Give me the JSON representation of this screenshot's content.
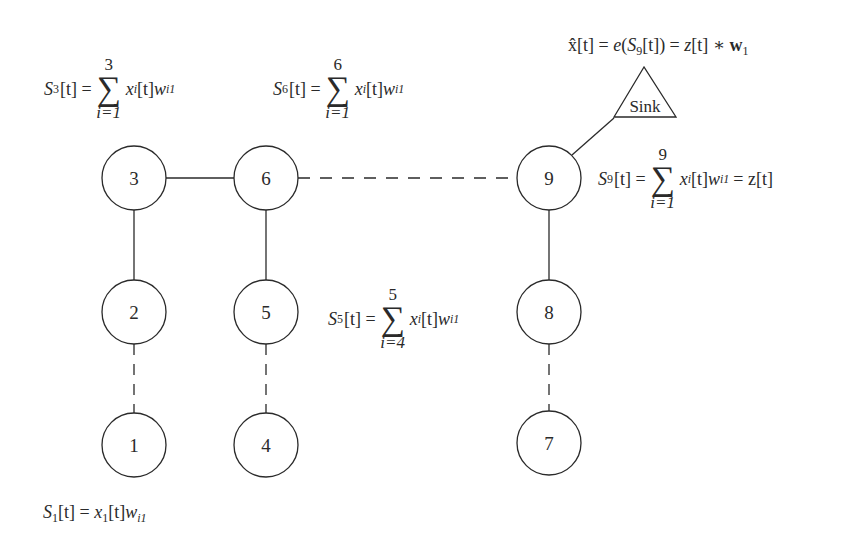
{
  "diagram": {
    "type": "sensor-network-aggregation",
    "nodes": [
      {
        "id": "1",
        "label": "1",
        "cx": 134,
        "cy": 445
      },
      {
        "id": "2",
        "label": "2",
        "cx": 134,
        "cy": 312
      },
      {
        "id": "3",
        "label": "3",
        "cx": 134,
        "cy": 178
      },
      {
        "id": "4",
        "label": "4",
        "cx": 266,
        "cy": 445
      },
      {
        "id": "5",
        "label": "5",
        "cx": 266,
        "cy": 312
      },
      {
        "id": "6",
        "label": "6",
        "cx": 266,
        "cy": 178
      },
      {
        "id": "7",
        "label": "7",
        "cx": 549,
        "cy": 443
      },
      {
        "id": "8",
        "label": "8",
        "cx": 549,
        "cy": 312
      },
      {
        "id": "9",
        "label": "9",
        "cx": 549,
        "cy": 178
      }
    ],
    "sink": {
      "label": "Sink"
    },
    "edges": [
      {
        "from": "3",
        "to": "6",
        "style": "solid"
      },
      {
        "from": "6",
        "to": "9",
        "style": "dashed"
      },
      {
        "from": "3",
        "to": "2",
        "style": "solid"
      },
      {
        "from": "2",
        "to": "1",
        "style": "dashed"
      },
      {
        "from": "6",
        "to": "5",
        "style": "solid"
      },
      {
        "from": "5",
        "to": "4",
        "style": "dashed"
      },
      {
        "from": "9",
        "to": "8",
        "style": "solid"
      },
      {
        "from": "8",
        "to": "7",
        "style": "dashed"
      },
      {
        "from": "9",
        "to": "Sink",
        "style": "solid"
      }
    ],
    "ink_color": "#2a2a2a"
  },
  "equations": {
    "s3": {
      "lhs_var": "S",
      "lhs_sub": "3",
      "arg": "[t] =",
      "upper": "3",
      "lower": "i=1",
      "body_x": "x",
      "body_sub": "i",
      "body_mid": "[t]",
      "body_w": "w",
      "body_wsub": "i1",
      "tail": ""
    },
    "s6": {
      "lhs_var": "S",
      "lhs_sub": "6",
      "arg": "[t] =",
      "upper": "6",
      "lower": "i=1",
      "body_x": "x",
      "body_sub": "i",
      "body_mid": "[t]",
      "body_w": "w",
      "body_wsub": "i1",
      "tail": ""
    },
    "s5": {
      "lhs_var": "S",
      "lhs_sub": "5",
      "arg": "[t] =",
      "upper": "5",
      "lower": "i=4",
      "body_x": "x",
      "body_sub": "i",
      "body_mid": "[t]",
      "body_w": "w",
      "body_wsub": "i1",
      "tail": ""
    },
    "s9": {
      "lhs_var": "S",
      "lhs_sub": "9",
      "arg": "[t] =",
      "upper": "9",
      "lower": "i=1",
      "body_x": "x",
      "body_sub": "i",
      "body_mid": "[t]",
      "body_w": "w",
      "body_wsub": "i1",
      "tail": "= z[t]"
    },
    "s1": {
      "text_lhs": "S",
      "lhs_sub": "1",
      "eq": "[t] = ",
      "x": "x",
      "x_sub": "1",
      "mid": "[t]",
      "w": "w",
      "w_sub": "i1"
    },
    "xhat": {
      "lhs": "x̂[t] = ",
      "e": "e",
      "open": "(",
      "s": "S",
      "s_sub": "9",
      "close": "[t]) = ",
      "z": "z",
      "ztail": "[t] ∗ ",
      "w": "w",
      "w_sub": "1"
    }
  }
}
